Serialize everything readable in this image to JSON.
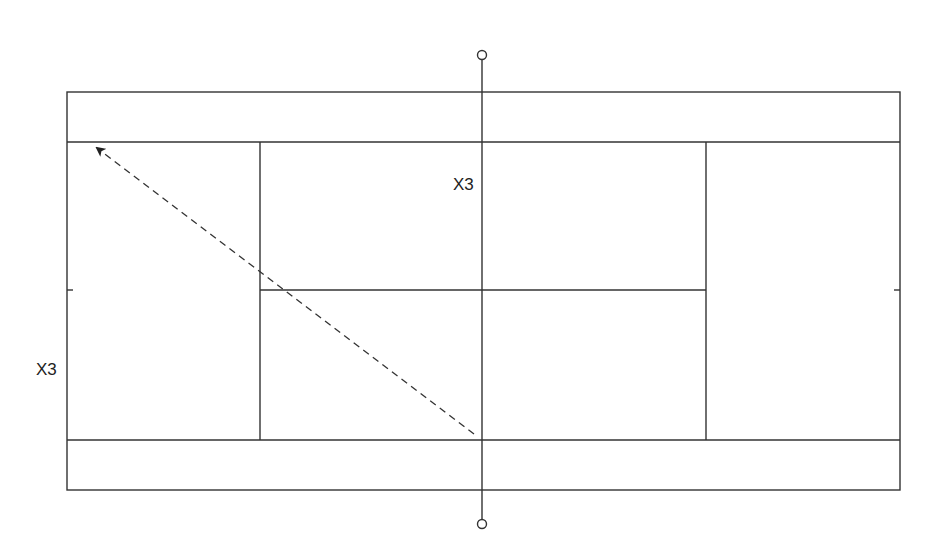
{
  "diagram": {
    "type": "tennis-court-drill",
    "colors": {
      "line": "#333333",
      "background": "#ffffff",
      "arrow": "#333333"
    },
    "court": {
      "outer": {
        "x1": 67,
        "y1": 92,
        "x2": 900,
        "y2": 490
      },
      "singles_lines_y": [
        142,
        440
      ],
      "service_lines_x": [
        260,
        706
      ],
      "center_service_line": {
        "y": 290,
        "x1": 260,
        "x2": 706
      },
      "center_marks": [
        {
          "x1": 67,
          "x2": 73,
          "y": 290
        },
        {
          "x1": 894,
          "x2": 900,
          "y": 290
        }
      ],
      "net": {
        "x": 482,
        "y1": 60,
        "y2": 519,
        "post_top": {
          "cx": 482,
          "cy": 55,
          "r": 4.5
        },
        "post_bottom": {
          "cx": 482,
          "cy": 524,
          "r": 4.5
        }
      }
    },
    "shot_arrow": {
      "style": "dashed",
      "from": {
        "x": 474,
        "y": 434
      },
      "to": {
        "x": 97,
        "y": 148
      }
    },
    "labels": [
      {
        "text": "X3",
        "x": 453,
        "y": 176
      },
      {
        "text": "X3",
        "x": 36,
        "y": 361
      }
    ]
  }
}
